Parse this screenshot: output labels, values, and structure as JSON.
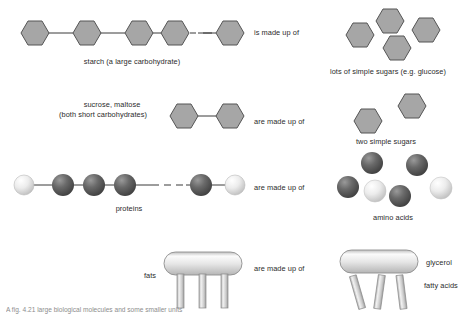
{
  "figure": {
    "caption": "A fig. 4.21 large biological molecules and some smaller units",
    "colors": {
      "hexagon_fill": "#a6a6a6",
      "hexagon_stroke": "#555555",
      "sphere_dark": "#585858",
      "sphere_light": "#e2e2e2",
      "bar_fill": "#c9c9c9",
      "capsule_fill": "#dcdcdc",
      "line": "#3a3a3a",
      "text": "#2b2b2b",
      "background": "#ffffff"
    }
  },
  "rows": [
    {
      "id": "carbohydrate-large",
      "left_label": "starch (a large carbohydrate)",
      "connector_text": "is made up of",
      "right_label": "lots of simple sugars (e.g. glucose)",
      "left_shape": "hexagon-chain-broken",
      "right_shape": "hexagon-cluster-4"
    },
    {
      "id": "carbohydrate-short",
      "left_label_line1": "sucrose, maltose",
      "left_label_line2": "(both short carbohydrates)",
      "connector_text": "are made up of",
      "right_label": "two simple sugars",
      "left_shape": "hexagon-pair",
      "right_shape": "hexagon-pair-loose"
    },
    {
      "id": "protein",
      "left_label": "proteins",
      "connector_text": "are made up of",
      "right_label": "amino acids",
      "left_shape": "sphere-chain-broken",
      "right_shape": "sphere-cluster-6"
    },
    {
      "id": "fat",
      "left_label": "fats",
      "connector_text": "are made up of",
      "right_label_glycerol": "glycerol",
      "right_label_fatty_acids": "fatty acids",
      "left_shape": "capsule-with-three-bars",
      "right_shape": "capsule-and-three-loose-bars"
    }
  ]
}
